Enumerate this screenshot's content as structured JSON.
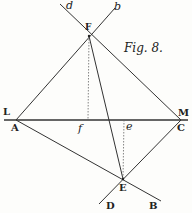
{
  "figure": {
    "title": "Fig. 8.",
    "labels": {
      "d": "d",
      "b": "b",
      "F": "F",
      "L": "L",
      "A": "A",
      "f": "f",
      "e": "e",
      "M": "M",
      "C": "C",
      "E": "E",
      "D": "D",
      "B": "B"
    },
    "points": {
      "F": [
        89,
        36
      ],
      "A": [
        16,
        120
      ],
      "C": [
        181,
        120
      ],
      "E": [
        123,
        179
      ],
      "f": [
        88,
        120
      ],
      "e": [
        124,
        120
      ],
      "d": [
        60,
        4
      ],
      "b": [
        115,
        8
      ],
      "D": [
        99,
        204
      ],
      "B": [
        161,
        201
      ],
      "L": [
        4,
        120
      ],
      "M": [
        188,
        120
      ]
    },
    "line_color": "#333333",
    "dotted_color": "#666666"
  }
}
